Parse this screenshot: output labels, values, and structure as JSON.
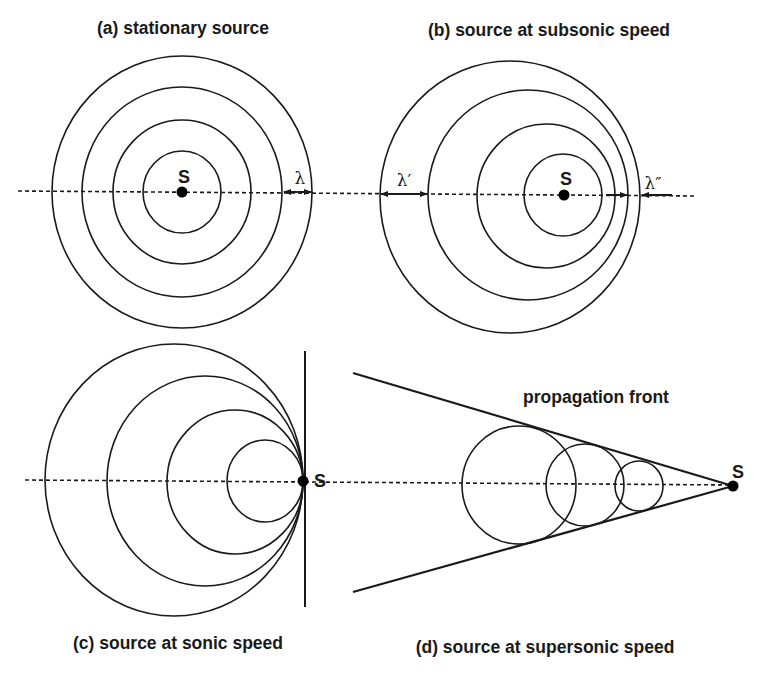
{
  "figure": {
    "panels": [
      {
        "id": "a",
        "title": "(a) stationary source",
        "title_pos": [
          183,
          34
        ],
        "source_label": "S",
        "source": [
          182,
          192
        ],
        "source_label_pos": [
          184,
          183
        ],
        "wavefronts": [
          {
            "cx": 182,
            "cy": 192,
            "rx": 130,
            "ry": 136
          },
          {
            "cx": 182,
            "cy": 192,
            "rx": 100,
            "ry": 105
          },
          {
            "cx": 182,
            "cy": 192,
            "rx": 69,
            "ry": 72
          },
          {
            "cx": 182,
            "cy": 192,
            "rx": 39,
            "ry": 41
          }
        ],
        "wavelength_markers": [
          {
            "label": "λ",
            "x1": 283,
            "x2": 312,
            "y": 192,
            "label_pos": [
              300,
              184
            ],
            "style": "double"
          }
        ]
      },
      {
        "id": "b",
        "title": "(b) source at subsonic speed",
        "title_pos": [
          549,
          36
        ],
        "source_label": "S",
        "source": [
          564,
          195
        ],
        "source_label_pos": [
          566,
          185
        ],
        "wavefronts": [
          {
            "cx": 510,
            "cy": 197,
            "rx": 130,
            "ry": 136
          },
          {
            "cx": 528,
            "cy": 195,
            "rx": 100,
            "ry": 105
          },
          {
            "cx": 546,
            "cy": 196,
            "rx": 69,
            "ry": 72
          },
          {
            "cx": 563,
            "cy": 195,
            "rx": 39,
            "ry": 41
          }
        ],
        "wavelength_markers": [
          {
            "label": "λ′",
            "x1": 380,
            "x2": 428,
            "y": 194,
            "label_pos": [
              404,
              186
            ],
            "style": "double"
          },
          {
            "label": "λ″",
            "x1": 602,
            "x2": 628,
            "y": 195,
            "label_pos": [
              653,
              189
            ],
            "style": "converge",
            "outer_x": 641,
            "outer_end": 672
          }
        ]
      },
      {
        "id": "c",
        "title": "(c) source at sonic speed",
        "title_pos": [
          178,
          649
        ],
        "source_label": "S",
        "source": [
          303,
          481
        ],
        "source_label_pos": [
          320,
          487
        ],
        "wavefronts": [
          {
            "cx": 174,
            "cy": 480,
            "rx": 129,
            "ry": 136
          },
          {
            "cx": 205,
            "cy": 481,
            "rx": 98,
            "ry": 105
          },
          {
            "cx": 235,
            "cy": 482,
            "rx": 68,
            "ry": 72
          },
          {
            "cx": 265,
            "cy": 481,
            "rx": 38,
            "ry": 41
          }
        ],
        "shock_line": {
          "x1": 305,
          "y1": 351,
          "x2": 305,
          "y2": 607
        }
      },
      {
        "id": "d",
        "title": "(d) source at supersonic speed",
        "title_pos": [
          545,
          653
        ],
        "source_label": "S",
        "source": [
          733,
          486
        ],
        "source_label_pos": [
          738,
          478
        ],
        "annotation": "propagation front",
        "annotation_pos": [
          596,
          403
        ],
        "wavefronts": [
          {
            "cx": 519,
            "cy": 485,
            "rx": 57,
            "ry": 59
          },
          {
            "cx": 585,
            "cy": 485,
            "rx": 39,
            "ry": 41
          },
          {
            "cx": 639,
            "cy": 486,
            "rx": 24,
            "ry": 25
          }
        ],
        "front_lines": [
          {
            "x1": 353,
            "y1": 373,
            "x2": 733,
            "y2": 486
          },
          {
            "x1": 353,
            "y1": 592,
            "x2": 733,
            "y2": 486
          }
        ]
      }
    ],
    "axes": [
      {
        "x1": 18,
        "y1": 191,
        "x2": 697,
        "y2": 196
      },
      {
        "x1": 25,
        "y1": 480,
        "x2": 733,
        "y2": 485
      }
    ]
  },
  "colors": {
    "ink": "#1a1a1a",
    "background": "#ffffff"
  }
}
